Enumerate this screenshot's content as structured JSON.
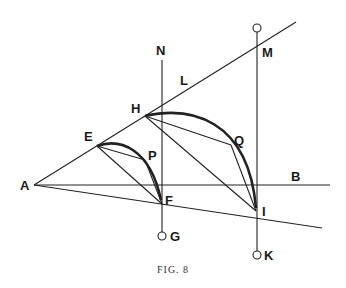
{
  "figure": {
    "caption": "Fig. 8",
    "caption_display": "FIG. 8",
    "colors": {
      "ink": "#222222",
      "background": "#ffffff"
    },
    "points": {
      "A": "A",
      "B": "B",
      "E": "E",
      "F": "F",
      "G": "G",
      "H": "H",
      "I": "I",
      "K": "K",
      "L": "L",
      "M": "M",
      "N": "N",
      "P": "P",
      "Q": "Q"
    }
  }
}
